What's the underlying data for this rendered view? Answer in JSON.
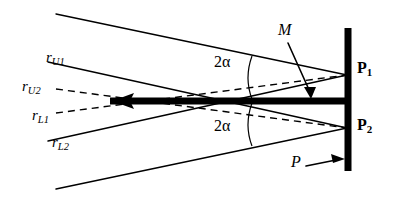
{
  "figure": {
    "background_color": "#ffffff",
    "stroke_color": "#000000",
    "width": 398,
    "height": 202
  },
  "labels": {
    "ray_upper_1": {
      "base": "r",
      "sub": "U1"
    },
    "ray_upper_2": {
      "base": "r",
      "sub": "U2"
    },
    "ray_lower_1": {
      "base": "r",
      "sub": "L1"
    },
    "ray_lower_2": {
      "base": "r",
      "sub": "L2"
    },
    "point_1": {
      "base": "P",
      "sub": "1"
    },
    "point_2": {
      "base": "P",
      "sub": "2"
    },
    "mirror": "M",
    "plane": "P",
    "angle_upper": "2α",
    "angle_lower": "2α"
  },
  "geometry": {
    "vertical_bar": {
      "x": 348,
      "y_top": 28,
      "y_bottom": 171,
      "thickness": 7
    },
    "horizontal_bar": {
      "x_left": 110,
      "x_right": 348,
      "y": 101,
      "thickness": 7
    },
    "focus_point": {
      "x": 347,
      "y_upper": 75,
      "y_lower": 128
    },
    "crossing_solid": {
      "x": 181,
      "y": 101
    },
    "crossing_dashed": {
      "x": 215,
      "y": 101
    },
    "arc_upper": {
      "x": 253,
      "y_top": 57,
      "y_bottom": 99
    },
    "arc_lower": {
      "x": 253,
      "y_top": 103,
      "y_bottom": 146
    }
  }
}
